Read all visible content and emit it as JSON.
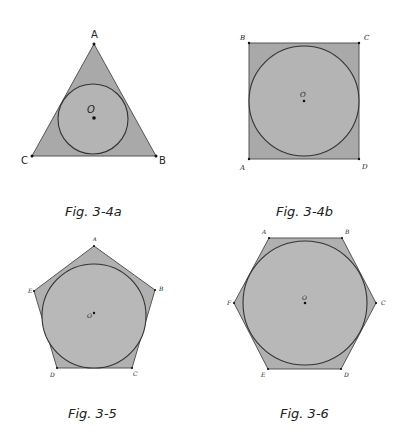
{
  "figures": [
    {
      "id": "fig-3-4a",
      "caption": "Fig. 3-4a",
      "shape": "equilateral-triangle",
      "vertices": [
        {
          "label": "A",
          "x": 94,
          "y": 44
        },
        {
          "label": "B",
          "x": 156,
          "y": 156
        },
        {
          "label": "C",
          "x": 32,
          "y": 156
        }
      ],
      "center_label": "O",
      "inscribed_circle": {
        "cx": 93,
        "cy": 119,
        "r": 35
      }
    },
    {
      "id": "fig-3-4b",
      "caption": "Fig. 3-4b",
      "shape": "square",
      "vertices": [
        {
          "label": "A",
          "x": 249,
          "y": 159
        },
        {
          "label": "B",
          "x": 249,
          "y": 43
        },
        {
          "label": "C",
          "x": 359,
          "y": 43
        },
        {
          "label": "D",
          "x": 359,
          "y": 159
        }
      ],
      "center_label": "O",
      "inscribed_circle": {
        "cx": 304,
        "cy": 101,
        "r": 55
      }
    },
    {
      "id": "fig-3-5",
      "caption": "Fig. 3-5",
      "shape": "regular-pentagon",
      "vertices": [
        {
          "label": "A",
          "x": 94,
          "y": 246
        },
        {
          "label": "B",
          "x": 155,
          "y": 290
        },
        {
          "label": "C",
          "x": 132,
          "y": 368
        },
        {
          "label": "D",
          "x": 57,
          "y": 368
        },
        {
          "label": "E",
          "x": 34,
          "y": 291
        }
      ],
      "center_label": "O",
      "inscribed_circle": {
        "cx": 94,
        "cy": 316,
        "r": 52
      }
    },
    {
      "id": "fig-3-6",
      "caption": "Fig. 3-6",
      "shape": "regular-hexagon",
      "vertices": [
        {
          "label": "A",
          "x": 269,
          "y": 238
        },
        {
          "label": "B",
          "x": 342,
          "y": 238
        },
        {
          "label": "C",
          "x": 376,
          "y": 303
        },
        {
          "label": "D",
          "x": 341,
          "y": 369
        },
        {
          "label": "E",
          "x": 268,
          "y": 369
        },
        {
          "label": "F",
          "x": 234,
          "y": 303
        }
      ],
      "center_label": "O",
      "inscribed_circle": {
        "cx": 305,
        "cy": 303,
        "r": 62
      }
    }
  ]
}
